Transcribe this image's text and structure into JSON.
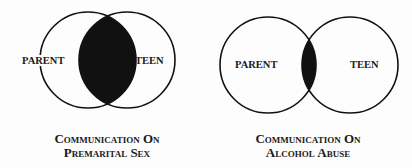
{
  "diagrams": [
    {
      "left_label": "PARENT",
      "right_label": "TEEN",
      "caption_line1": "Communication On",
      "caption_line2": "Premarital Sex",
      "overlap": "large"
    },
    {
      "left_label": "PARENT",
      "right_label": "TEEN",
      "caption_line1": "Communication On",
      "caption_line2": "Alcohol Abuse",
      "overlap": "small"
    }
  ],
  "colors": {
    "stroke": "#111111",
    "fill": "#111111",
    "background": "#fdfdfd"
  }
}
